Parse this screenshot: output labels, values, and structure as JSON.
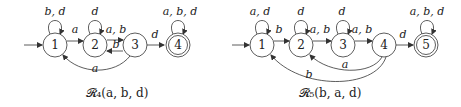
{
  "automata": [
    {
      "caption": "𝓡₄(a, b, d)",
      "states": [
        "1",
        "2",
        "3",
        "4"
      ],
      "initial": "1",
      "accepting": [
        "4"
      ],
      "labels": {
        "loop1": "b, d",
        "loop2": "d",
        "loop4": "a, b, d",
        "e12": "a",
        "e23": "a, b",
        "e32": "b",
        "e34": "d",
        "e31": "a"
      }
    },
    {
      "caption": "𝓡₅(b, a, d)",
      "states": [
        "1",
        "2",
        "3",
        "4",
        "5"
      ],
      "initial": "1",
      "accepting": [
        "5"
      ],
      "labels": {
        "loop1": "a, d",
        "loop2": "d",
        "loop3": "d",
        "loop5": "a, b, d",
        "e12": "b",
        "e23": "a, b",
        "e34": "a, b",
        "e45": "d",
        "e42": "a",
        "e41": "b"
      }
    }
  ]
}
